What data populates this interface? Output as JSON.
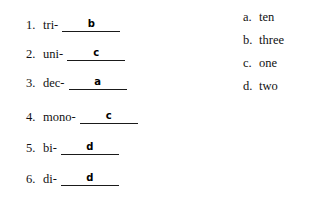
{
  "worksheet": {
    "background_color": "#ffffff",
    "ink_color": "#111111",
    "answer_ink_color": "#000000",
    "questions": [
      {
        "number": "1.",
        "prefix": "tri-",
        "answer": "b"
      },
      {
        "number": "2.",
        "prefix": "uni-",
        "answer": "c"
      },
      {
        "number": "3.",
        "prefix": "dec-",
        "answer": "a"
      },
      {
        "number": "4.",
        "prefix": "mono-",
        "answer": "c"
      },
      {
        "number": "5.",
        "prefix": "bi-",
        "answer": "d"
      },
      {
        "number": "6.",
        "prefix": "di-",
        "answer": "d"
      }
    ],
    "choices": [
      {
        "letter": "a.",
        "text": "ten"
      },
      {
        "letter": "b.",
        "text": "three"
      },
      {
        "letter": "c.",
        "text": "one"
      },
      {
        "letter": "d.",
        "text": "two"
      }
    ]
  }
}
